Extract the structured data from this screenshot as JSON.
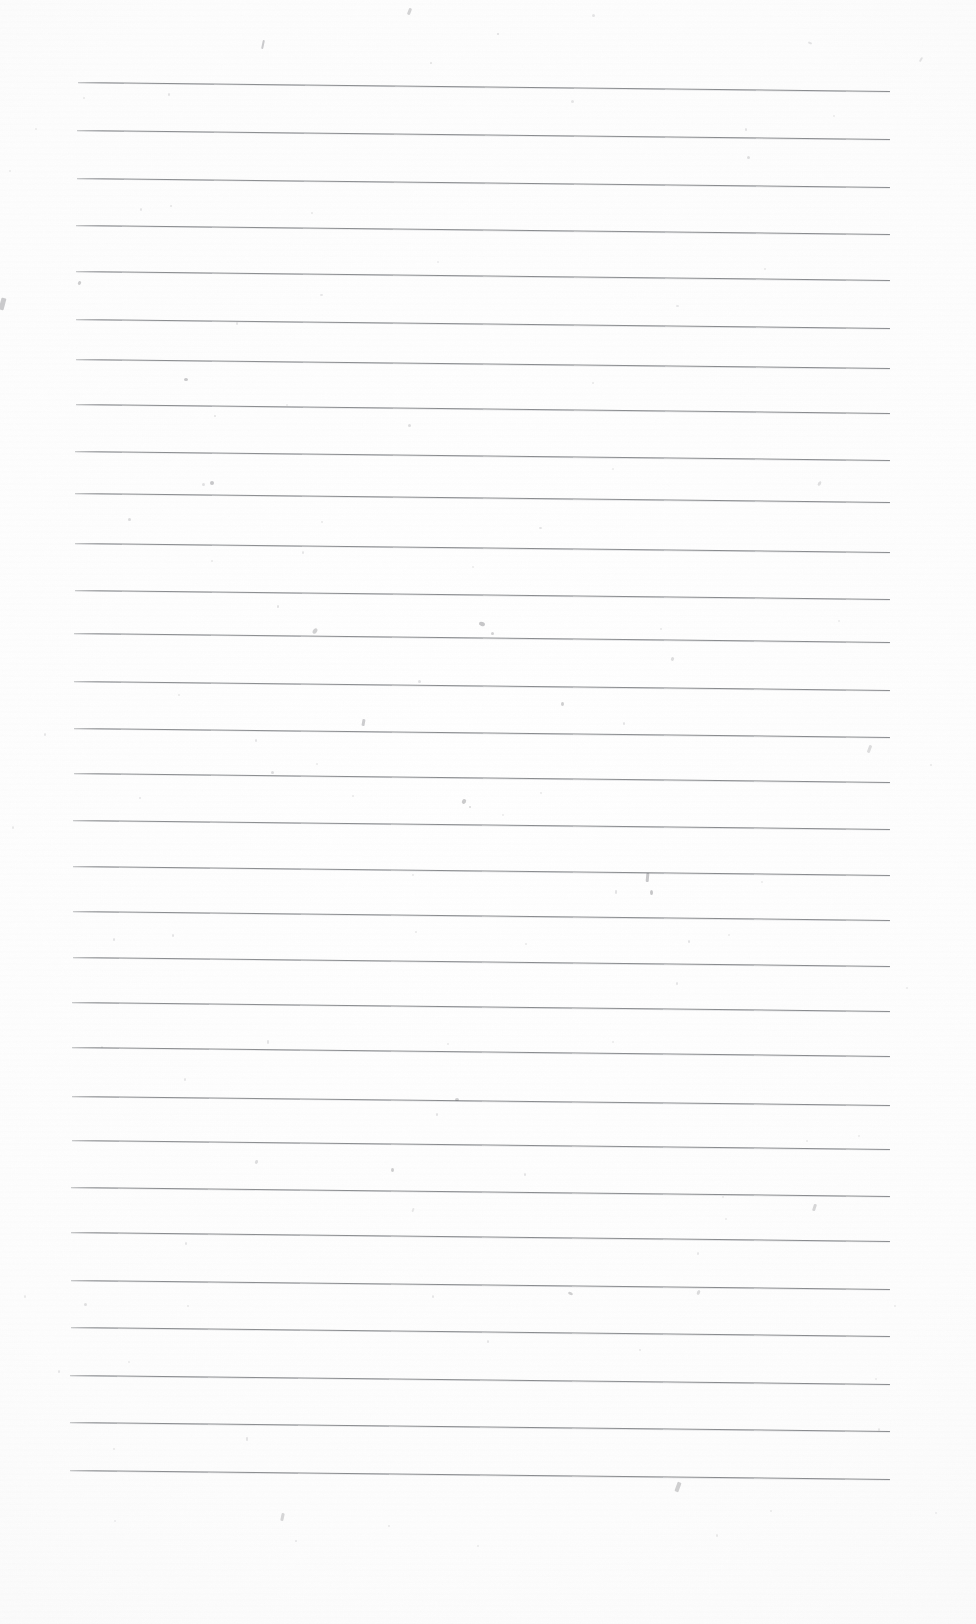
{
  "document": {
    "type": "scanned-lined-paper",
    "title": "Blank ruled notebook page (scan)",
    "page_width": 976,
    "page_height": 1624,
    "has_text": false,
    "text_content": "",
    "background_color": "#fefefe",
    "rule_color": "#696b70",
    "rule_count": 30,
    "rule_spacing_px": 47.5,
    "rule_left_x": 78,
    "rule_right_x": 890,
    "rule_first_y": 82,
    "rule_last_y": 1470,
    "rule_slope_px": 9,
    "margins": {
      "top": 82,
      "left": 78,
      "right": 86,
      "bottom": 154
    }
  },
  "rules": [
    {
      "id": 1,
      "y": 82,
      "x": 78,
      "w": 812,
      "slope": 9
    },
    {
      "id": 2,
      "y": 130,
      "x": 77,
      "w": 813,
      "slope": 9
    },
    {
      "id": 3,
      "y": 178,
      "x": 77,
      "w": 813,
      "slope": 9
    },
    {
      "id": 4,
      "y": 225,
      "x": 76,
      "w": 814,
      "slope": 9
    },
    {
      "id": 5,
      "y": 271,
      "x": 76,
      "w": 814,
      "slope": 9
    },
    {
      "id": 6,
      "y": 319,
      "x": 76,
      "w": 814,
      "slope": 9
    },
    {
      "id": 7,
      "y": 359,
      "x": 76,
      "w": 814,
      "slope": 9
    },
    {
      "id": 8,
      "y": 404,
      "x": 76,
      "w": 814,
      "slope": 9
    },
    {
      "id": 9,
      "y": 451,
      "x": 75,
      "w": 815,
      "slope": 9
    },
    {
      "id": 10,
      "y": 493,
      "x": 75,
      "w": 815,
      "slope": 9
    },
    {
      "id": 11,
      "y": 543,
      "x": 75,
      "w": 815,
      "slope": 9
    },
    {
      "id": 12,
      "y": 590,
      "x": 75,
      "w": 815,
      "slope": 9
    },
    {
      "id": 13,
      "y": 633,
      "x": 74,
      "w": 816,
      "slope": 9
    },
    {
      "id": 14,
      "y": 681,
      "x": 74,
      "w": 816,
      "slope": 9
    },
    {
      "id": 15,
      "y": 728,
      "x": 74,
      "w": 816,
      "slope": 9
    },
    {
      "id": 16,
      "y": 773,
      "x": 74,
      "w": 816,
      "slope": 9
    },
    {
      "id": 17,
      "y": 820,
      "x": 73,
      "w": 817,
      "slope": 9
    },
    {
      "id": 18,
      "y": 866,
      "x": 73,
      "w": 817,
      "slope": 9
    },
    {
      "id": 19,
      "y": 911,
      "x": 73,
      "w": 817,
      "slope": 9
    },
    {
      "id": 20,
      "y": 957,
      "x": 73,
      "w": 817,
      "slope": 9
    },
    {
      "id": 21,
      "y": 1002,
      "x": 72,
      "w": 818,
      "slope": 9
    },
    {
      "id": 22,
      "y": 1047,
      "x": 72,
      "w": 818,
      "slope": 9
    },
    {
      "id": 23,
      "y": 1096,
      "x": 72,
      "w": 818,
      "slope": 9
    },
    {
      "id": 24,
      "y": 1140,
      "x": 72,
      "w": 818,
      "slope": 9
    },
    {
      "id": 25,
      "y": 1187,
      "x": 71,
      "w": 819,
      "slope": 9
    },
    {
      "id": 26,
      "y": 1232,
      "x": 71,
      "w": 819,
      "slope": 9
    },
    {
      "id": 27,
      "y": 1280,
      "x": 71,
      "w": 819,
      "slope": 9
    },
    {
      "id": 28,
      "y": 1327,
      "x": 71,
      "w": 819,
      "slope": 9
    },
    {
      "id": 29,
      "y": 1375,
      "x": 70,
      "w": 820,
      "slope": 9
    },
    {
      "id": 30,
      "y": 1422,
      "x": 70,
      "w": 820,
      "slope": 9
    },
    {
      "id": 31,
      "y": 1470,
      "x": 70,
      "w": 820,
      "slope": 9
    }
  ],
  "specks": [
    {
      "x": 408,
      "y": 8,
      "w": 3,
      "h": 7,
      "rot": 20,
      "o": 0.45
    },
    {
      "x": 262,
      "y": 40,
      "w": 2,
      "h": 9,
      "rot": 12,
      "o": 0.55
    },
    {
      "x": 497,
      "y": 33,
      "w": 2,
      "h": 2,
      "rot": 0,
      "o": 0.28
    },
    {
      "x": 592,
      "y": 14,
      "w": 3,
      "h": 3,
      "rot": 0,
      "o": 0.22
    },
    {
      "x": 430,
      "y": 62,
      "w": 2,
      "h": 2,
      "rot": 0,
      "o": 0.25
    },
    {
      "x": 808,
      "y": 42,
      "w": 4,
      "h": 2,
      "rot": 24,
      "o": 0.28
    },
    {
      "x": 920,
      "y": 57,
      "w": 2,
      "h": 5,
      "rot": 30,
      "o": 0.28
    },
    {
      "x": 83,
      "y": 97,
      "w": 2,
      "h": 2,
      "rot": 0,
      "o": 0.2
    },
    {
      "x": 168,
      "y": 93,
      "w": 2,
      "h": 3,
      "rot": 0,
      "o": 0.25
    },
    {
      "x": 571,
      "y": 100,
      "w": 3,
      "h": 3,
      "rot": 0,
      "o": 0.22
    },
    {
      "x": 745,
      "y": 128,
      "w": 2,
      "h": 3,
      "rot": 0,
      "o": 0.25
    },
    {
      "x": 833,
      "y": 115,
      "w": 2,
      "h": 2,
      "rot": 0,
      "o": 0.18
    },
    {
      "x": 747,
      "y": 156,
      "w": 3,
      "h": 3,
      "rot": 0,
      "o": 0.3
    },
    {
      "x": 35,
      "y": 128,
      "w": 2,
      "h": 2,
      "rot": 0,
      "o": 0.18
    },
    {
      "x": 140,
      "y": 208,
      "w": 2,
      "h": 3,
      "rot": 0,
      "o": 0.22
    },
    {
      "x": 170,
      "y": 205,
      "w": 2,
      "h": 2,
      "rot": 0,
      "o": 0.24
    },
    {
      "x": 311,
      "y": 212,
      "w": 2,
      "h": 2,
      "rot": 0,
      "o": 0.2
    },
    {
      "x": 9,
      "y": 170,
      "w": 2,
      "h": 2,
      "rot": 0,
      "o": 0.18
    },
    {
      "x": 78,
      "y": 281,
      "w": 3,
      "h": 4,
      "rot": 30,
      "o": 0.45
    },
    {
      "x": 320,
      "y": 294,
      "w": 3,
      "h": 2,
      "rot": 0,
      "o": 0.22
    },
    {
      "x": 676,
      "y": 305,
      "w": 3,
      "h": 2,
      "rot": 0,
      "o": 0.22
    },
    {
      "x": 437,
      "y": 261,
      "w": 2,
      "h": 2,
      "rot": 0,
      "o": 0.16
    },
    {
      "x": 764,
      "y": 268,
      "w": 2,
      "h": 2,
      "rot": 0,
      "o": 0.2
    },
    {
      "x": 0,
      "y": 298,
      "w": 5,
      "h": 12,
      "rot": 15,
      "o": 0.55
    },
    {
      "x": 184,
      "y": 378,
      "w": 4,
      "h": 3,
      "rot": 0,
      "o": 0.5
    },
    {
      "x": 236,
      "y": 322,
      "w": 2,
      "h": 3,
      "rot": 0,
      "o": 0.22
    },
    {
      "x": 408,
      "y": 424,
      "w": 3,
      "h": 3,
      "rot": 0,
      "o": 0.3
    },
    {
      "x": 214,
      "y": 415,
      "w": 2,
      "h": 2,
      "rot": 0,
      "o": 0.25
    },
    {
      "x": 592,
      "y": 382,
      "w": 2,
      "h": 2,
      "rot": 0,
      "o": 0.2
    },
    {
      "x": 286,
      "y": 404,
      "w": 2,
      "h": 2,
      "rot": 0,
      "o": 0.18
    },
    {
      "x": 202,
      "y": 483,
      "w": 3,
      "h": 3,
      "rot": 0,
      "o": 0.26
    },
    {
      "x": 210,
      "y": 481,
      "w": 4,
      "h": 4,
      "rot": 0,
      "o": 0.5
    },
    {
      "x": 128,
      "y": 518,
      "w": 3,
      "h": 3,
      "rot": 0,
      "o": 0.32
    },
    {
      "x": 321,
      "y": 521,
      "w": 2,
      "h": 2,
      "rot": 0,
      "o": 0.2
    },
    {
      "x": 539,
      "y": 527,
      "w": 3,
      "h": 2,
      "rot": 0,
      "o": 0.24
    },
    {
      "x": 818,
      "y": 481,
      "w": 3,
      "h": 5,
      "rot": 30,
      "o": 0.28
    },
    {
      "x": 612,
      "y": 468,
      "w": 2,
      "h": 2,
      "rot": 0,
      "o": 0.18
    },
    {
      "x": 211,
      "y": 560,
      "w": 2,
      "h": 2,
      "rot": 0,
      "o": 0.2
    },
    {
      "x": 302,
      "y": 551,
      "w": 2,
      "h": 3,
      "rot": 0,
      "o": 0.22
    },
    {
      "x": 472,
      "y": 566,
      "w": 2,
      "h": 2,
      "rot": 0,
      "o": 0.18
    },
    {
      "x": 277,
      "y": 605,
      "w": 2,
      "h": 3,
      "rot": 0,
      "o": 0.28
    },
    {
      "x": 313,
      "y": 628,
      "w": 4,
      "h": 6,
      "rot": 35,
      "o": 0.42
    },
    {
      "x": 479,
      "y": 622,
      "w": 6,
      "h": 4,
      "rot": 20,
      "o": 0.52
    },
    {
      "x": 491,
      "y": 632,
      "w": 3,
      "h": 3,
      "rot": 0,
      "o": 0.4
    },
    {
      "x": 660,
      "y": 628,
      "w": 2,
      "h": 2,
      "rot": 0,
      "o": 0.2
    },
    {
      "x": 838,
      "y": 620,
      "w": 2,
      "h": 2,
      "rot": 0,
      "o": 0.18
    },
    {
      "x": 418,
      "y": 680,
      "w": 3,
      "h": 3,
      "rot": 0,
      "o": 0.26
    },
    {
      "x": 671,
      "y": 657,
      "w": 3,
      "h": 4,
      "rot": 25,
      "o": 0.3
    },
    {
      "x": 178,
      "y": 694,
      "w": 2,
      "h": 2,
      "rot": 0,
      "o": 0.2
    },
    {
      "x": 561,
      "y": 702,
      "w": 3,
      "h": 4,
      "rot": 0,
      "o": 0.45
    },
    {
      "x": 362,
      "y": 719,
      "w": 3,
      "h": 7,
      "rot": 10,
      "o": 0.52
    },
    {
      "x": 623,
      "y": 722,
      "w": 2,
      "h": 3,
      "rot": 0,
      "o": 0.25
    },
    {
      "x": 255,
      "y": 739,
      "w": 2,
      "h": 3,
      "rot": 0,
      "o": 0.24
    },
    {
      "x": 44,
      "y": 733,
      "w": 2,
      "h": 3,
      "rot": 0,
      "o": 0.22
    },
    {
      "x": 868,
      "y": 745,
      "w": 3,
      "h": 8,
      "rot": 20,
      "o": 0.35
    },
    {
      "x": 930,
      "y": 764,
      "w": 2,
      "h": 2,
      "rot": 0,
      "o": 0.2
    },
    {
      "x": 271,
      "y": 771,
      "w": 3,
      "h": 3,
      "rot": 0,
      "o": 0.3
    },
    {
      "x": 316,
      "y": 763,
      "w": 2,
      "h": 2,
      "rot": 0,
      "o": 0.2
    },
    {
      "x": 139,
      "y": 797,
      "w": 2,
      "h": 2,
      "rot": 0,
      "o": 0.22
    },
    {
      "x": 352,
      "y": 795,
      "w": 2,
      "h": 2,
      "rot": 0,
      "o": 0.2
    },
    {
      "x": 462,
      "y": 799,
      "w": 4,
      "h": 5,
      "rot": 30,
      "o": 0.48
    },
    {
      "x": 469,
      "y": 806,
      "w": 2,
      "h": 2,
      "rot": 0,
      "o": 0.35
    },
    {
      "x": 540,
      "y": 792,
      "w": 2,
      "h": 2,
      "rot": 0,
      "o": 0.2
    },
    {
      "x": 502,
      "y": 814,
      "w": 2,
      "h": 2,
      "rot": 0,
      "o": 0.18
    },
    {
      "x": 12,
      "y": 826,
      "w": 2,
      "h": 3,
      "rot": 0,
      "o": 0.2
    },
    {
      "x": 412,
      "y": 874,
      "w": 2,
      "h": 2,
      "rot": 0,
      "o": 0.2
    },
    {
      "x": 646,
      "y": 873,
      "w": 3,
      "h": 9,
      "rot": 5,
      "o": 0.58
    },
    {
      "x": 650,
      "y": 890,
      "w": 3,
      "h": 5,
      "rot": 0,
      "o": 0.52
    },
    {
      "x": 615,
      "y": 890,
      "w": 2,
      "h": 4,
      "rot": 0,
      "o": 0.28
    },
    {
      "x": 761,
      "y": 881,
      "w": 2,
      "h": 2,
      "rot": 0,
      "o": 0.18
    },
    {
      "x": 113,
      "y": 938,
      "w": 2,
      "h": 3,
      "rot": 0,
      "o": 0.24
    },
    {
      "x": 172,
      "y": 934,
      "w": 2,
      "h": 3,
      "rot": 0,
      "o": 0.24
    },
    {
      "x": 415,
      "y": 931,
      "w": 2,
      "h": 2,
      "rot": 0,
      "o": 0.2
    },
    {
      "x": 525,
      "y": 943,
      "w": 2,
      "h": 2,
      "rot": 0,
      "o": 0.2
    },
    {
      "x": 688,
      "y": 940,
      "w": 2,
      "h": 3,
      "rot": 0,
      "o": 0.26
    },
    {
      "x": 728,
      "y": 934,
      "w": 2,
      "h": 2,
      "rot": 0,
      "o": 0.18
    },
    {
      "x": 676,
      "y": 982,
      "w": 2,
      "h": 3,
      "rot": 0,
      "o": 0.25
    },
    {
      "x": 906,
      "y": 987,
      "w": 2,
      "h": 2,
      "rot": 0,
      "o": 0.18
    },
    {
      "x": 267,
      "y": 1040,
      "w": 2,
      "h": 4,
      "rot": 0,
      "o": 0.26
    },
    {
      "x": 447,
      "y": 1043,
      "w": 2,
      "h": 2,
      "rot": 0,
      "o": 0.2
    },
    {
      "x": 612,
      "y": 1041,
      "w": 2,
      "h": 2,
      "rot": 0,
      "o": 0.18
    },
    {
      "x": 101,
      "y": 1046,
      "w": 2,
      "h": 2,
      "rot": 0,
      "o": 0.18
    },
    {
      "x": 184,
      "y": 1078,
      "w": 2,
      "h": 3,
      "rot": 0,
      "o": 0.22
    },
    {
      "x": 455,
      "y": 1098,
      "w": 4,
      "h": 3,
      "rot": 0,
      "o": 0.42
    },
    {
      "x": 436,
      "y": 1113,
      "w": 2,
      "h": 3,
      "rot": 0,
      "o": 0.26
    },
    {
      "x": 858,
      "y": 1135,
      "w": 2,
      "h": 2,
      "rot": 0,
      "o": 0.18
    },
    {
      "x": 806,
      "y": 1140,
      "w": 2,
      "h": 2,
      "rot": 0,
      "o": 0.18
    },
    {
      "x": 255,
      "y": 1160,
      "w": 3,
      "h": 4,
      "rot": 20,
      "o": 0.3
    },
    {
      "x": 391,
      "y": 1168,
      "w": 3,
      "h": 4,
      "rot": 0,
      "o": 0.45
    },
    {
      "x": 524,
      "y": 1173,
      "w": 2,
      "h": 3,
      "rot": 0,
      "o": 0.25
    },
    {
      "x": 412,
      "y": 1208,
      "w": 2,
      "h": 4,
      "rot": 20,
      "o": 0.24
    },
    {
      "x": 813,
      "y": 1204,
      "w": 3,
      "h": 7,
      "rot": 18,
      "o": 0.42
    },
    {
      "x": 722,
      "y": 1196,
      "w": 2,
      "h": 2,
      "rot": 0,
      "o": 0.18
    },
    {
      "x": 725,
      "y": 1218,
      "w": 2,
      "h": 2,
      "rot": 0,
      "o": 0.18
    },
    {
      "x": 185,
      "y": 1242,
      "w": 2,
      "h": 3,
      "rot": 0,
      "o": 0.24
    },
    {
      "x": 697,
      "y": 1252,
      "w": 2,
      "h": 3,
      "rot": 0,
      "o": 0.22
    },
    {
      "x": 84,
      "y": 1303,
      "w": 3,
      "h": 3,
      "rot": 0,
      "o": 0.28
    },
    {
      "x": 187,
      "y": 1305,
      "w": 2,
      "h": 2,
      "rot": 0,
      "o": 0.2
    },
    {
      "x": 432,
      "y": 1295,
      "w": 2,
      "h": 3,
      "rot": 0,
      "o": 0.22
    },
    {
      "x": 568,
      "y": 1292,
      "w": 5,
      "h": 3,
      "rot": 25,
      "o": 0.42
    },
    {
      "x": 697,
      "y": 1290,
      "w": 3,
      "h": 5,
      "rot": 25,
      "o": 0.32
    },
    {
      "x": 24,
      "y": 1295,
      "w": 2,
      "h": 3,
      "rot": 0,
      "o": 0.2
    },
    {
      "x": 894,
      "y": 1305,
      "w": 2,
      "h": 2,
      "rot": 0,
      "o": 0.18
    },
    {
      "x": 487,
      "y": 1340,
      "w": 2,
      "h": 3,
      "rot": 0,
      "o": 0.22
    },
    {
      "x": 639,
      "y": 1349,
      "w": 2,
      "h": 2,
      "rot": 0,
      "o": 0.2
    },
    {
      "x": 128,
      "y": 1361,
      "w": 2,
      "h": 2,
      "rot": 0,
      "o": 0.18
    },
    {
      "x": 58,
      "y": 1370,
      "w": 2,
      "h": 3,
      "rot": 0,
      "o": 0.22
    },
    {
      "x": 875,
      "y": 1378,
      "w": 2,
      "h": 2,
      "rot": 0,
      "o": 0.18
    },
    {
      "x": 246,
      "y": 1437,
      "w": 2,
      "h": 4,
      "rot": 0,
      "o": 0.26
    },
    {
      "x": 113,
      "y": 1448,
      "w": 2,
      "h": 2,
      "rot": 0,
      "o": 0.2
    },
    {
      "x": 878,
      "y": 1428,
      "w": 2,
      "h": 3,
      "rot": 0,
      "o": 0.2
    },
    {
      "x": 676,
      "y": 1482,
      "w": 4,
      "h": 10,
      "rot": 20,
      "o": 0.5
    },
    {
      "x": 281,
      "y": 1513,
      "w": 3,
      "h": 8,
      "rot": 12,
      "o": 0.42
    },
    {
      "x": 295,
      "y": 1540,
      "w": 2,
      "h": 2,
      "rot": 0,
      "o": 0.22
    },
    {
      "x": 388,
      "y": 1525,
      "w": 2,
      "h": 2,
      "rot": 0,
      "o": 0.2
    },
    {
      "x": 477,
      "y": 1545,
      "w": 2,
      "h": 2,
      "rot": 0,
      "o": 0.18
    },
    {
      "x": 716,
      "y": 1534,
      "w": 2,
      "h": 3,
      "rot": 0,
      "o": 0.2
    },
    {
      "x": 770,
      "y": 1510,
      "w": 2,
      "h": 2,
      "rot": 0,
      "o": 0.18
    },
    {
      "x": 114,
      "y": 1520,
      "w": 2,
      "h": 2,
      "rot": 0,
      "o": 0.16
    },
    {
      "x": 935,
      "y": 1512,
      "w": 2,
      "h": 2,
      "rot": 0,
      "o": 0.16
    }
  ]
}
